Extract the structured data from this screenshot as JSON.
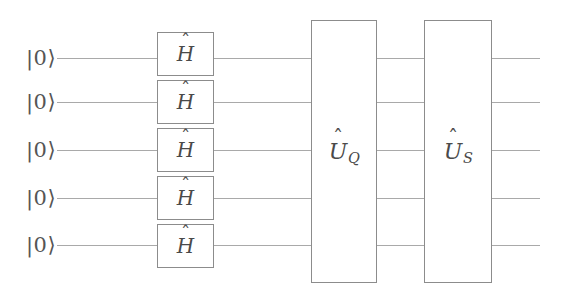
{
  "figure": {
    "kind": "quantum-circuit-diagram",
    "width": 567,
    "height": 300,
    "background_color": "#ffffff",
    "wire_color": "#a9a9a9",
    "box_border_color": "#8c8c8c",
    "label_color": "#4a4a4a"
  },
  "qubits": [
    {
      "id": "q1",
      "init_label": "|0⟩",
      "wire_y": 58
    },
    {
      "id": "q2",
      "init_label": "|0⟩",
      "wire_y": 102
    },
    {
      "id": "q3",
      "init_label": "|0⟩",
      "wire_y": 150
    },
    {
      "id": "q4",
      "init_label": "|0⟩",
      "wire_y": 198
    },
    {
      "id": "q5",
      "init_label": "|0⟩",
      "wire_y": 245
    }
  ],
  "hadamard_gates": [
    {
      "target": "q1",
      "symbol": "H",
      "accent": "ˆ"
    },
    {
      "target": "q2",
      "symbol": "H",
      "accent": "ˆ"
    },
    {
      "target": "q3",
      "symbol": "H",
      "accent": "ˆ"
    },
    {
      "target": "q4",
      "symbol": "H",
      "accent": "ˆ"
    },
    {
      "target": "q5",
      "symbol": "H",
      "accent": "ˆ"
    }
  ],
  "unitary_gates": [
    {
      "id": "u-q",
      "symbol": "U",
      "accent": "ˆ",
      "subscript": "Q",
      "spans_all_qubits": true
    },
    {
      "id": "u-s",
      "symbol": "U",
      "accent": "ˆ",
      "subscript": "S",
      "spans_all_qubits": true
    }
  ]
}
